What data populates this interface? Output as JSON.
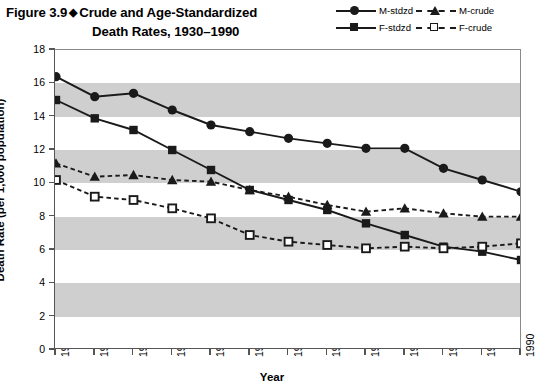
{
  "header": {
    "figure_label": "Figure 3.9",
    "diamond_glyph": "◆",
    "title_line1": "Crude and Age-Standardized",
    "title_line2": "Death Rates, 1930–1990"
  },
  "legend": {
    "position": "top-right",
    "items": [
      {
        "label": "M-stdzd",
        "marker": "filled-circle",
        "line": "solid",
        "color": "#1a1a1a"
      },
      {
        "label": "M-crude",
        "marker": "filled-triangle",
        "line": "dashed",
        "color": "#1a1a1a"
      },
      {
        "label": "F-stdzd",
        "marker": "filled-square",
        "line": "solid",
        "color": "#1a1a1a"
      },
      {
        "label": "F-crude",
        "marker": "open-square",
        "line": "dashed",
        "color": "#1a1a1a"
      }
    ]
  },
  "axes": {
    "y_label": "Death Rate (per 1,000 population)",
    "x_label": "Year",
    "y_ticks": [
      "0",
      "2",
      "4",
      "6",
      "8",
      "10",
      "12",
      "14",
      "16",
      "18"
    ],
    "x_ticks": [
      "1930",
      "1935",
      "1940",
      "1945",
      "1950",
      "1955",
      "1960",
      "1965",
      "1970",
      "1975",
      "1980",
      "1985",
      "1990"
    ]
  },
  "style": {
    "band_color": "#cfcfcf",
    "line_color": "#1a1a1a",
    "frame_color": "#555555",
    "plot_background": "#ffffff"
  },
  "chart_data": {
    "type": "line",
    "xlabel": "Year",
    "ylabel": "Death Rate (per 1,000 population)",
    "x": [
      1930,
      1935,
      1940,
      1945,
      1950,
      1955,
      1960,
      1965,
      1970,
      1975,
      1980,
      1985,
      1990
    ],
    "xlim": [
      1930,
      1990
    ],
    "ylim": [
      0,
      18
    ],
    "y_tick_step": 2,
    "grid": false,
    "banded_background": true,
    "band_ranges": [
      [
        2,
        4
      ],
      [
        6,
        8
      ],
      [
        10,
        12
      ],
      [
        14,
        16
      ]
    ],
    "legend_position": "top-right",
    "series": [
      {
        "name": "M-stdzd",
        "marker": "filled-circle",
        "line": "solid",
        "values": [
          16.4,
          15.2,
          15.4,
          14.4,
          13.5,
          13.1,
          12.7,
          12.4,
          12.1,
          12.1,
          10.9,
          10.2,
          9.5
        ]
      },
      {
        "name": "F-stdzd",
        "marker": "filled-square",
        "line": "solid",
        "values": [
          15.0,
          13.9,
          13.2,
          12.0,
          10.8,
          9.6,
          9.0,
          8.4,
          7.6,
          6.9,
          6.2,
          5.9,
          5.4
        ]
      },
      {
        "name": "M-crude",
        "marker": "filled-triangle",
        "line": "dashed",
        "values": [
          11.2,
          10.4,
          10.5,
          10.2,
          10.1,
          9.6,
          9.2,
          8.7,
          8.3,
          8.5,
          8.2,
          8.0,
          8.0
        ]
      },
      {
        "name": "F-crude",
        "marker": "open-square",
        "line": "dashed",
        "values": [
          10.2,
          9.2,
          9.0,
          8.5,
          7.9,
          6.9,
          6.5,
          6.3,
          6.1,
          6.2,
          6.1,
          6.2,
          6.4
        ]
      }
    ]
  }
}
